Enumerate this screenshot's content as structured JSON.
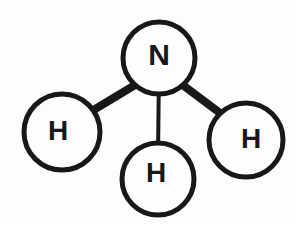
{
  "diagram": {
    "molecule_formula": "NH3",
    "background_color": "#fdfdfd",
    "ink_color": "#18181a",
    "canvas": {
      "width": 298,
      "height": 225
    }
  },
  "atoms": [
    {
      "id": "nitrogen-center",
      "label": "N",
      "element": "Nitrogen",
      "cx": 159,
      "cy": 58,
      "r": 36,
      "stroke_width": 5,
      "font_size": 30,
      "label_dx": 0,
      "label_dy": -4
    },
    {
      "id": "hydrogen-left",
      "label": "H",
      "element": "Hydrogen",
      "cx": 62,
      "cy": 132,
      "r": 38,
      "stroke_width": 5,
      "font_size": 28,
      "label_dx": -4,
      "label_dy": -2
    },
    {
      "id": "hydrogen-bottom",
      "label": "H",
      "element": "Hydrogen",
      "cx": 158,
      "cy": 179,
      "r": 36,
      "stroke_width": 5,
      "font_size": 28,
      "label_dx": -2,
      "label_dy": -7
    },
    {
      "id": "hydrogen-right",
      "label": "H",
      "element": "Hydrogen",
      "cx": 246,
      "cy": 140,
      "r": 37,
      "stroke_width": 5,
      "font_size": 28,
      "label_dx": 5,
      "label_dy": -2
    }
  ],
  "bonds": [
    {
      "id": "bond-n-h-left",
      "from": "nitrogen-center",
      "to": "hydrogen-left",
      "order": 1,
      "x1": 140,
      "y1": 82,
      "x2": 82,
      "y2": 117,
      "stroke_width": 8
    },
    {
      "id": "bond-n-h-bottom",
      "from": "nitrogen-center",
      "to": "hydrogen-bottom",
      "order": 1,
      "x1": 159,
      "y1": 68,
      "x2": 158,
      "y2": 157,
      "stroke_width": 4
    },
    {
      "id": "bond-n-h-right",
      "from": "nitrogen-center",
      "to": "hydrogen-right",
      "order": 1,
      "x1": 180,
      "y1": 83,
      "x2": 232,
      "y2": 122,
      "stroke_width": 8
    }
  ]
}
